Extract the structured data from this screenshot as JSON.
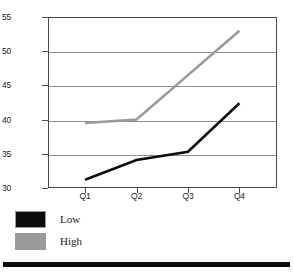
{
  "chart_data": {
    "type": "line",
    "title": "",
    "xlabel": "",
    "ylabel": "",
    "categories": [
      "Q1",
      "Q2",
      "Q3",
      "Q4"
    ],
    "series": [
      {
        "name": "Low",
        "color": "#0d0d0d",
        "values": [
          31.2,
          34.1,
          35.3,
          42.4
        ]
      },
      {
        "name": "High",
        "color": "#9a9a9a",
        "values": [
          39.5,
          40.0,
          46.5,
          53.0
        ]
      }
    ],
    "ylim": [
      30,
      55
    ],
    "yticks": [
      30,
      35,
      40,
      45,
      50,
      55
    ],
    "ytick_labels": [
      "30",
      "35",
      "40",
      "45",
      "50",
      "55"
    ],
    "grid": true,
    "legend_position": "below-left"
  },
  "legend": {
    "entries": [
      {
        "label": "Low",
        "swatch_color": "#0d0d0d"
      },
      {
        "label": "High",
        "swatch_color": "#9a9a9a"
      }
    ]
  },
  "colors": {
    "axis": "#4a4a4a",
    "gridline": "#8e8e8e",
    "low_series": "#0d0d0d",
    "high_series": "#9a9a9a",
    "bottom_rule": "#0d0d0d",
    "background": "#ffffff"
  }
}
